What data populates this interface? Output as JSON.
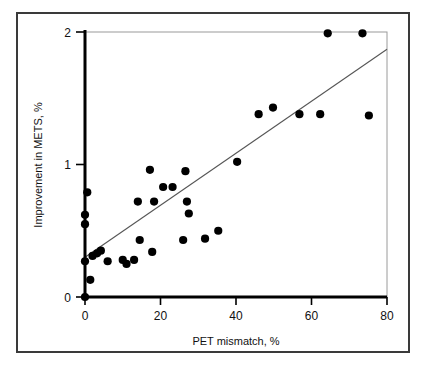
{
  "figure": {
    "frame_color": "#3a3a3a",
    "axis_color": "#000000",
    "point_color": "#000000",
    "line_color": "#555555",
    "background": "#ffffff"
  },
  "chart_data": {
    "type": "scatter",
    "title": "",
    "xlabel": "PET mismatch, %",
    "ylabel": "Improvement in METS, %",
    "xlim": [
      0,
      80
    ],
    "ylim": [
      0,
      2
    ],
    "xticks": [
      0,
      20,
      40,
      60,
      80
    ],
    "yticks": [
      0,
      1,
      2
    ],
    "xtick_labels": [
      "0",
      "20",
      "40",
      "60",
      "80"
    ],
    "ytick_labels": [
      "0",
      "1",
      "2"
    ],
    "grid": false,
    "legend": null,
    "points": [
      [
        0.0,
        0.0
      ],
      [
        0.0,
        0.27
      ],
      [
        0.0,
        0.55
      ],
      [
        0.0,
        0.62
      ],
      [
        0.6,
        0.79
      ],
      [
        1.4,
        0.13
      ],
      [
        2.0,
        0.31
      ],
      [
        3.2,
        0.33
      ],
      [
        4.2,
        0.35
      ],
      [
        6.0,
        0.27
      ],
      [
        10.0,
        0.28
      ],
      [
        11.0,
        0.25
      ],
      [
        13.0,
        0.28
      ],
      [
        14.0,
        0.72
      ],
      [
        14.5,
        0.43
      ],
      [
        17.2,
        0.96
      ],
      [
        17.8,
        0.34
      ],
      [
        18.3,
        0.72
      ],
      [
        20.7,
        0.83
      ],
      [
        23.2,
        0.83
      ],
      [
        26.0,
        0.43
      ],
      [
        26.6,
        0.95
      ],
      [
        27.0,
        0.72
      ],
      [
        27.5,
        0.63
      ],
      [
        31.8,
        0.44
      ],
      [
        35.3,
        0.5
      ],
      [
        40.3,
        1.02
      ],
      [
        46.0,
        1.38
      ],
      [
        49.8,
        1.43
      ],
      [
        56.8,
        1.38
      ],
      [
        62.3,
        1.38
      ],
      [
        64.3,
        1.99
      ],
      [
        73.5,
        1.99
      ],
      [
        75.2,
        1.37
      ]
    ],
    "fit_line": {
      "type": "linear-regression",
      "x_start": 0.0,
      "y_start": 0.3,
      "x_end": 80.0,
      "y_end": 1.87
    }
  }
}
